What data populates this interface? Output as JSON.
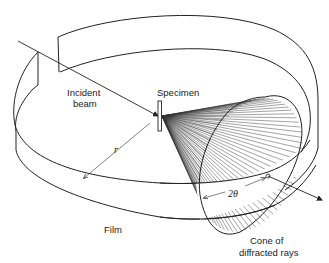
{
  "figure": {
    "colors": {
      "ink": "#222222",
      "background": "#ffffff"
    }
  },
  "labels": {
    "incident_beam_line1": "Incident",
    "incident_beam_line2": "beam",
    "specimen": "Specimen",
    "radius": "r",
    "film": "Film",
    "two_theta": "2θ",
    "cone_line1": "Cone of",
    "cone_line2": "diffracted rays"
  }
}
